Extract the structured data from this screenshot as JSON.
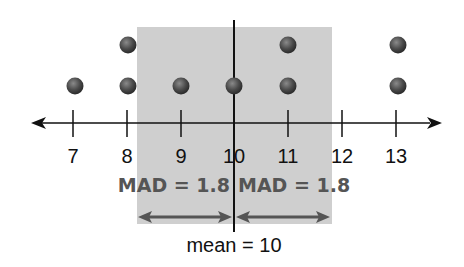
{
  "diagram": {
    "type": "dot-plot",
    "axis": {
      "min_label": 7,
      "max_label": 13,
      "tick_labels": [
        "7",
        "8",
        "9",
        "10",
        "11",
        "12",
        "13"
      ]
    },
    "data_points": [
      7,
      8,
      8,
      9,
      10,
      11,
      11,
      13,
      13
    ],
    "dot_counts": {
      "7": 1,
      "8": 2,
      "9": 1,
      "10": 1,
      "11": 2,
      "12": 0,
      "13": 2
    },
    "shaded_region": {
      "from": 8.2,
      "to": 11.8
    },
    "mean_line_value": 10,
    "left_label": "MAD = 1.8",
    "right_label": "MAD = 1.8",
    "mean_label": "mean = 10",
    "colors": {
      "shade": "#cfcfcf",
      "dot": "#4a4a4a",
      "label_gray": "#555555"
    }
  }
}
